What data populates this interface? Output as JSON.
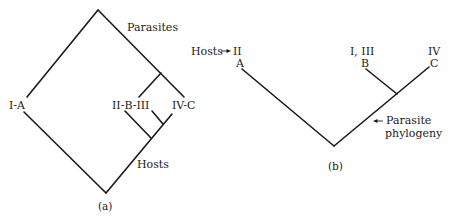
{
  "panel_a": {
    "caption": "(a)",
    "labels": {
      "parasites": "Parasites",
      "hosts": "Hosts",
      "leaf_1": "I-A",
      "leaf_2": "II-B-III",
      "leaf_3": "IV-C"
    }
  },
  "panel_b": {
    "caption": "(b)",
    "hosts_label": "Hosts",
    "parasite_phylogeny_line1": "Parasite",
    "parasite_phylogeny_line2": "phylogeny",
    "leaves": [
      {
        "hosts": "II",
        "parasite": "A"
      },
      {
        "hosts": "I, III",
        "parasite": "B"
      },
      {
        "hosts": "IV",
        "parasite": "C"
      }
    ]
  },
  "colors": {
    "line": "#1a1a1a",
    "text": "#222222",
    "background": "#ffffff"
  }
}
